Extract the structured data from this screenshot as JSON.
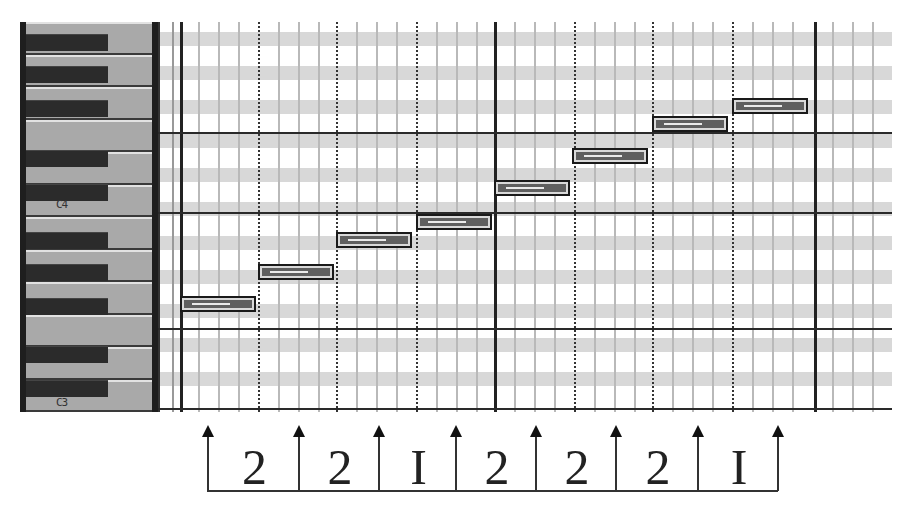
{
  "keyboard": {
    "labels": [
      {
        "text": "C4",
        "top": 176
      },
      {
        "text": "C3",
        "top": 374
      }
    ],
    "white_keys": 12,
    "black_key_tops": [
      12,
      44,
      78,
      128,
      162,
      210,
      242,
      276,
      324,
      358
    ]
  },
  "grid": {
    "stripe_tops": [
      10,
      44,
      78,
      112,
      146,
      180,
      214,
      248,
      282,
      316,
      350
    ],
    "minor_lines": [
      18,
      38,
      58,
      98,
      118,
      138,
      176,
      196,
      216,
      256,
      276,
      296,
      334,
      354,
      374,
      414,
      434,
      454,
      492,
      512,
      532,
      572,
      592,
      612,
      652,
      672,
      692
    ],
    "beat_lines": [
      78,
      156,
      236,
      394,
      472,
      552
    ],
    "bar_lines": [
      0,
      314,
      634
    ],
    "h_lines": [
      110,
      190,
      306,
      386
    ],
    "notes": [
      {
        "pitch": "C3",
        "left": 0,
        "top": 274,
        "width": 76
      },
      {
        "pitch": "D3",
        "left": 78,
        "top": 242,
        "width": 76
      },
      {
        "pitch": "E3",
        "left": 156,
        "top": 210,
        "width": 76
      },
      {
        "pitch": "F3",
        "left": 236,
        "top": 192,
        "width": 76
      },
      {
        "pitch": "G3",
        "left": 314,
        "top": 158,
        "width": 76
      },
      {
        "pitch": "A3",
        "left": 392,
        "top": 126,
        "width": 76
      },
      {
        "pitch": "B3",
        "left": 472,
        "top": 94,
        "width": 76
      },
      {
        "pitch": "C4",
        "left": 552,
        "top": 76,
        "width": 76
      }
    ]
  },
  "intervals": {
    "arrow_x": [
      207,
      298,
      378,
      455,
      535,
      615,
      697,
      777
    ],
    "values": [
      "2",
      "2",
      "1",
      "2",
      "2",
      "2",
      "1"
    ],
    "glyphs": [
      "2",
      "2",
      "I",
      "2",
      "2",
      "2",
      "I"
    ]
  }
}
